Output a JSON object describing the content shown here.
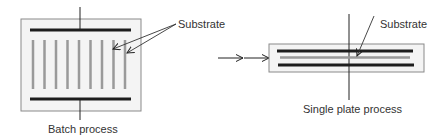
{
  "diagram": {
    "batch": {
      "caption": "Batch process",
      "substrate_label": "Substrate",
      "substrate_count": 9
    },
    "single": {
      "caption": "Single plate process",
      "substrate_label": "Substrate"
    }
  },
  "colors": {
    "chamber_fill": "#f4f4f4",
    "chamber_stroke": "#8a8a8a",
    "electrode": "#1e1e1e",
    "substrate": "#9a9a9a",
    "line": "#222222"
  }
}
